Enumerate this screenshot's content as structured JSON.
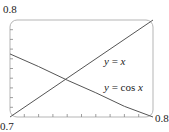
{
  "chart_data": {
    "type": "line",
    "title": "",
    "xlabel": "",
    "ylabel": "",
    "xlim": [
      0.7,
      0.8
    ],
    "ylim": [
      0.7,
      0.8
    ],
    "grid": false,
    "tick_labels": {
      "x_min": "0.7",
      "x_max": "0.8",
      "y_max": "0.8"
    },
    "x_ticks_count": 10,
    "y_ticks_count": 10,
    "series": [
      {
        "name": "y = x",
        "x": [
          0.7,
          0.8
        ],
        "y": [
          0.7,
          0.8
        ]
      },
      {
        "name": "y = cos x",
        "x": [
          0.7,
          0.72,
          0.74,
          0.76,
          0.78,
          0.8
        ],
        "y": [
          0.765,
          0.752,
          0.738,
          0.725,
          0.711,
          0.697
        ]
      }
    ],
    "annotations": [
      {
        "text": "y = x",
        "var": "y",
        "eq": " = ",
        "expr": "x"
      },
      {
        "text": "y = cos x",
        "var": "y",
        "eq": " = cos ",
        "expr": "x"
      }
    ]
  },
  "colors": {
    "frame": "#b5b5b5",
    "line": "#555555"
  }
}
